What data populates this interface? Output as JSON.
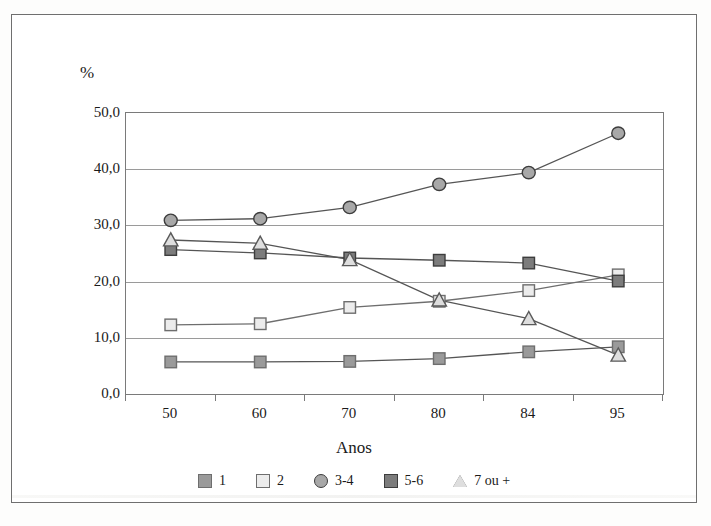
{
  "figure": {
    "y_axis_title": "%",
    "x_axis_title": "Anos"
  },
  "chart_data": {
    "type": "line",
    "title": "",
    "subtitle": "",
    "xlabel": "Anos",
    "ylabel": "%",
    "categories": [
      "50",
      "60",
      "70",
      "80",
      "84",
      "95"
    ],
    "ylim": [
      0.0,
      50.0
    ],
    "yticks": [
      "0,0",
      "10,0",
      "20,0",
      "30,0",
      "40,0",
      "50,0"
    ],
    "ytick_values": [
      0.0,
      10.0,
      20.0,
      30.0,
      40.0,
      50.0
    ],
    "grid": "horizontal",
    "legend_position": "bottom",
    "decimal_separator": ",",
    "series": [
      {
        "name": "1",
        "marker": "square",
        "marker_fill": "#9a9a9a",
        "marker_stroke": "#6e6e6e",
        "line_color": "#555555",
        "values": [
          5.7,
          5.7,
          5.8,
          6.3,
          7.5,
          8.4
        ]
      },
      {
        "name": "2",
        "marker": "square",
        "marker_fill": "#ececec",
        "marker_stroke": "#6e6e6e",
        "line_color": "#6e6e6e",
        "values": [
          12.3,
          12.5,
          15.4,
          16.5,
          18.4,
          21.2
        ]
      },
      {
        "name": "3-4",
        "marker": "circle",
        "marker_fill": "#a8a8a8",
        "marker_stroke": "#3d3d3d",
        "line_color": "#555555",
        "values": [
          30.9,
          31.2,
          33.2,
          37.3,
          39.4,
          46.4
        ]
      },
      {
        "name": "5-6",
        "marker": "square",
        "marker_fill": "#7c7c7c",
        "marker_stroke": "#3d3d3d",
        "line_color": "#555555",
        "values": [
          25.7,
          25.1,
          24.2,
          23.8,
          23.3,
          20.1
        ]
      },
      {
        "name": "7 ou +",
        "marker": "triangle",
        "marker_fill": "#dedede",
        "marker_stroke": "#5a5a5a",
        "line_color": "#555555",
        "values": [
          27.4,
          26.8,
          23.9,
          16.7,
          13.4,
          6.9
        ]
      }
    ]
  },
  "legend": {
    "items": [
      {
        "label": "1",
        "swatch": "square-gray-icon"
      },
      {
        "label": "2",
        "swatch": "square-white-icon"
      },
      {
        "label": "3-4",
        "swatch": "circle-gray-icon"
      },
      {
        "label": "5-6",
        "swatch": "square-darkgray-icon"
      },
      {
        "label": "7 ou +",
        "swatch": "triangle-white-icon"
      }
    ]
  },
  "colors": {
    "frame": "#6f6f6f",
    "axis": "#7a7a7a",
    "gridline": "#9a9a9a",
    "text": "#1a1a1a",
    "background": "#ffffff"
  }
}
